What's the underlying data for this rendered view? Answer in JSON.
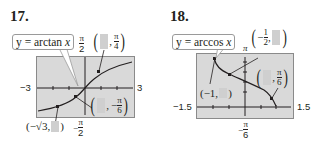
{
  "problems": [
    {
      "number": "17.",
      "function_label": "y = arctan x",
      "window": {
        "xmin": "−3",
        "xmax": "3",
        "ymax": "π/2",
        "ymin": "−π/2"
      },
      "points": [
        {
          "label_prefix": "(",
          "x": "blank",
          "y": "π/4",
          "label_suffix": ")"
        },
        {
          "label_prefix": "(",
          "x": "blank",
          "y": "−π/6",
          "label_suffix": ")"
        },
        {
          "label_prefix": "(−√3,",
          "x": "−√3",
          "y": "blank",
          "label_suffix": ")"
        }
      ],
      "texts": {
        "ymax_num": "π",
        "ymax_den": "2",
        "ymin_sign": "−",
        "ymin_num": "π",
        "ymin_den": "2",
        "pt1_num": "π",
        "pt1_den": "4",
        "pt2_sign": "−",
        "pt2_num": "π",
        "pt2_den": "6",
        "pt3_text": "(−√3,",
        "pt3_close": ")"
      }
    },
    {
      "number": "18.",
      "function_label": "y = arccos x",
      "window": {
        "xmin": "−1.5",
        "xmax": "1.5",
        "ymax": "π",
        "ymin": "−π/6"
      },
      "points": [
        {
          "x": "−1/2",
          "y": "blank"
        },
        {
          "x": "blank",
          "y": "π/6"
        },
        {
          "x": "−1",
          "y": "blank"
        }
      ],
      "texts": {
        "ymax": "π",
        "ymin_sign": "−",
        "ymin_num": "π",
        "ymin_den": "6",
        "pt1_sign": "−",
        "pt1_num": "1",
        "pt1_den": "2",
        "pt2_num": "π",
        "pt2_den": "6",
        "pt3_text": "(−1,",
        "pt3_close": ")"
      }
    }
  ],
  "labels": {
    "p17_fn_prefix": "y = arctan ",
    "p17_fn_var": "x",
    "p18_fn_prefix": "y = arccos ",
    "p18_fn_var": "x"
  }
}
